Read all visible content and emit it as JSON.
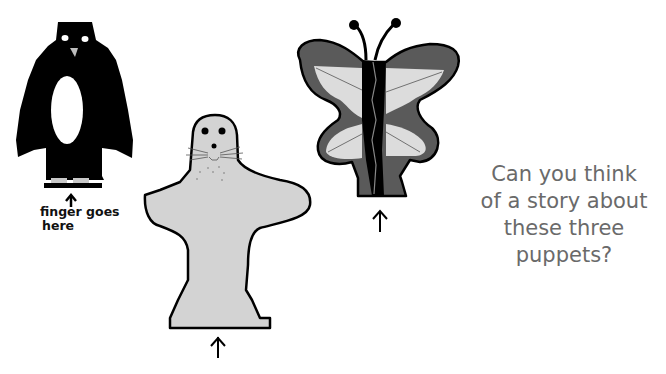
{
  "puppets": [
    {
      "name": "penguin",
      "label_line1": "finger goes",
      "label_line2": "here",
      "colors": {
        "body": "#000000",
        "belly": "#ffffff",
        "feet": "#c8c8c8",
        "beak": "#bdbdbd"
      }
    },
    {
      "name": "seal",
      "colors": {
        "body": "#d3d3d3",
        "outline": "#000000"
      }
    },
    {
      "name": "butterfly",
      "colors": {
        "outer_wing": "#5a5a5a",
        "inner_wing": "#dcdcdc",
        "body": "#000000"
      }
    }
  ],
  "question": {
    "line1": "Can you think",
    "line2": "of a story about",
    "line3": "these three",
    "line4": "puppets?",
    "color": "#6a6a6a"
  }
}
